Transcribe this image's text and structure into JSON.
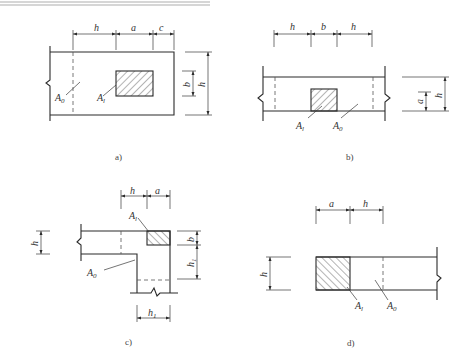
{
  "figure": {
    "panels": [
      {
        "id": "a",
        "caption": "a)",
        "top_dims": [
          "h",
          "a",
          "c"
        ],
        "right_dims": [
          "b",
          "h"
        ],
        "area_labels": {
          "bearing": "A",
          "bearing_sub": "l",
          "distribution": "A",
          "distribution_sub": "0"
        }
      },
      {
        "id": "b",
        "caption": "b)",
        "top_dims": [
          "h",
          "b",
          "h"
        ],
        "right_dims": [
          "a",
          "h"
        ],
        "area_labels": {
          "bearing": "A",
          "bearing_sub": "l",
          "distribution": "A",
          "distribution_sub": "0"
        }
      },
      {
        "id": "c",
        "caption": "c)",
        "top_dims": [
          "h",
          "a"
        ],
        "left_dims": [
          "h"
        ],
        "right_dims": [
          "b",
          "h",
          "h_sub"
        ],
        "bottom_dims": [
          "h",
          "h_sub"
        ],
        "subscript_1": "1",
        "area_labels": {
          "bearing": "A",
          "bearing_sub": "l",
          "distribution": "A",
          "distribution_sub": "0"
        }
      },
      {
        "id": "d",
        "caption": "d)",
        "top_dims": [
          "a",
          "h"
        ],
        "left_dims": [
          "h"
        ],
        "area_labels": {
          "bearing": "A",
          "bearing_sub": "l",
          "distribution": "A",
          "distribution_sub": "0"
        }
      }
    ]
  },
  "colors": {
    "line": "#2a2a2a",
    "background": "#ffffff",
    "text": "#333333"
  }
}
